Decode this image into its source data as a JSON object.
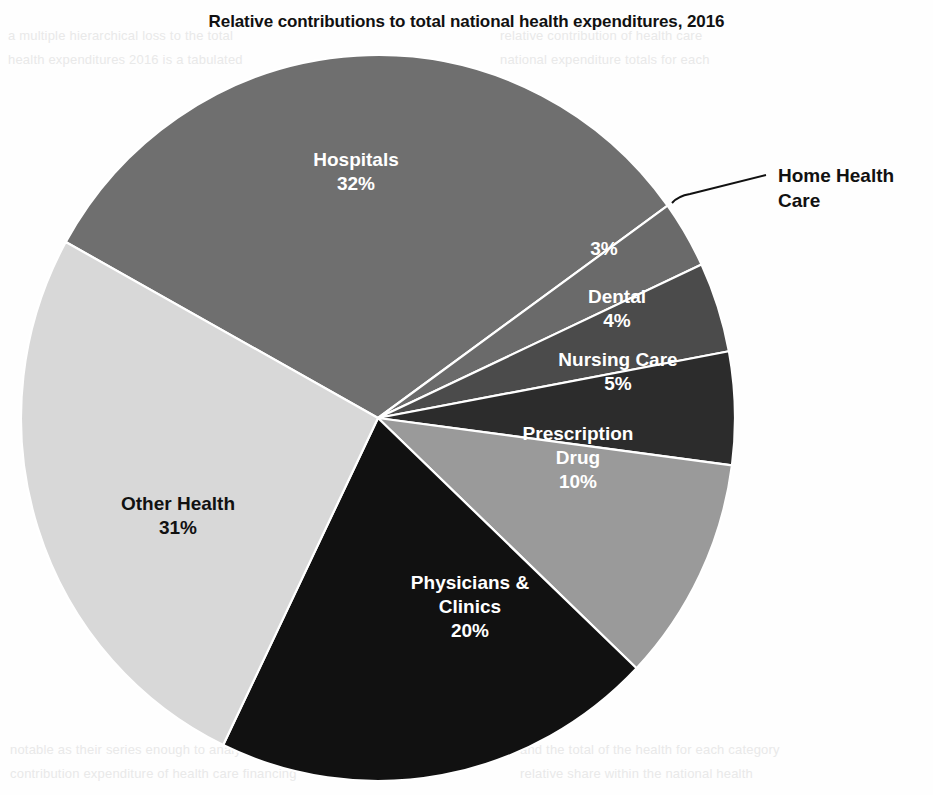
{
  "page": {
    "background_color": "#fefefe",
    "bleed_text": [
      {
        "text": "a multiple hierarchical loss to the total",
        "x": 8,
        "y": 28
      },
      {
        "text": "health expenditures 2016 is a tabulated",
        "x": 8,
        "y": 52
      },
      {
        "text": "relative contribution of health care",
        "x": 500,
        "y": 28
      },
      {
        "text": "national expenditure totals for each",
        "x": 500,
        "y": 52
      },
      {
        "text": "notable as their series enough to analysis and the",
        "x": 10,
        "y": 742
      },
      {
        "text": "contribution expenditure of health care financing",
        "x": 10,
        "y": 766
      },
      {
        "text": "and the total of the health for each category",
        "x": 520,
        "y": 742
      },
      {
        "text": "relative share within the national health",
        "x": 520,
        "y": 766
      }
    ]
  },
  "chart_data": {
    "type": "pie",
    "title": "Relative contributions to total national health expenditures, 2016",
    "unit": "%",
    "total": 105,
    "legend": "none",
    "labels_inside": true,
    "categories": [
      "Hospitals",
      "Home Health Care",
      "Dental",
      "Nursing Care",
      "Prescription Drug",
      "Physicians & Clinics",
      "Other Health"
    ],
    "values": [
      32,
      3,
      4,
      5,
      10,
      20,
      31
    ],
    "slices": [
      {
        "name": "Hospitals",
        "label": "Hospitals",
        "value_label": "32%",
        "value": 32,
        "color": "#6f6f6f",
        "label_color": "#ffffff",
        "label_style": "inside",
        "label_x": 356,
        "label_y": 178,
        "start_angle": -61,
        "end_angle": 54.2
      },
      {
        "name": "Home Health Care",
        "label": "Home Health Care",
        "value_label": "3%",
        "value": 3,
        "color": "#6a6a6a",
        "label_color": "#ffffff",
        "label_style": "callout",
        "label_x": 778,
        "label_y": 182,
        "value_x": 604,
        "value_y": 255,
        "start_angle": 54.2,
        "end_angle": 65.0,
        "leader_from_x": 672,
        "leader_from_y": 203,
        "leader_to_x": 766,
        "leader_to_y": 175
      },
      {
        "name": "Dental",
        "label": "Dental",
        "value_label": "4%",
        "value": 4,
        "color": "#4b4b4b",
        "label_color": "#ffffff",
        "label_style": "inside",
        "label_x": 617,
        "label_y": 315,
        "start_angle": 65.0,
        "end_angle": 79.4
      },
      {
        "name": "Nursing Care",
        "label": "Nursing Care",
        "value_label": "5%",
        "value": 5,
        "color": "#2c2c2c",
        "label_color": "#ffffff",
        "label_style": "inside",
        "label_x": 618,
        "label_y": 378,
        "start_angle": 79.4,
        "end_angle": 97.5
      },
      {
        "name": "Prescription Drug",
        "label": "Prescription Drug",
        "value_label": "10%",
        "value": 10,
        "color": "#9a9a9a",
        "label_color": "#ffffff",
        "label_style": "inside",
        "label_x": 578,
        "label_y": 464,
        "start_angle": 97.5,
        "end_angle": 133.6
      },
      {
        "name": "Physicians & Clinics",
        "label": "Physicians & Clinics",
        "value_label": "20%",
        "value": 20,
        "color": "#111111",
        "label_color": "#ffffff",
        "label_style": "inside",
        "label_x": 470,
        "label_y": 613,
        "start_angle": 133.6,
        "end_angle": 205.7
      },
      {
        "name": "Other Health",
        "label": "Other Health",
        "value_label": "31%",
        "value": 31,
        "color": "#d8d8d8",
        "label_color": "#111111",
        "label_style": "inside",
        "label_x": 178,
        "label_y": 522,
        "start_angle": 205.7,
        "end_angle": 299
      }
    ],
    "geometry": {
      "center_x": 378,
      "center_y": 418,
      "radius_x": 357,
      "radius_y": 363,
      "separator_color": "#ffffff",
      "separator_width": 2.2
    }
  }
}
